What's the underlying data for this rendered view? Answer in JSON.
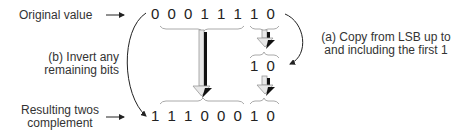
{
  "labels": {
    "original": "Original value",
    "result_line1": "Resulting twos",
    "result_line2": "complement",
    "step_b_line1": "(b) Invert any",
    "step_b_line2": "remaining bits",
    "step_a_line1": "(a) Copy from LSB up to",
    "step_a_line2": "and including the first  1"
  },
  "original_bits": [
    "0",
    "0",
    "0",
    "1",
    "1",
    "1",
    "1",
    "0"
  ],
  "copied_bits": [
    "1",
    "0"
  ],
  "result_bits": [
    "1",
    "1",
    "1",
    "0",
    "0",
    "0",
    "1",
    "0"
  ]
}
